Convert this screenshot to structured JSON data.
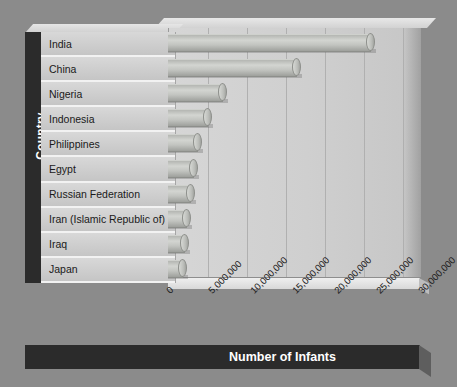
{
  "chart_data": {
    "type": "bar",
    "orientation": "horizontal",
    "title": "",
    "xlabel": "Number of Infants",
    "ylabel": "Country",
    "categories": [
      "India",
      "China",
      "Nigeria",
      "Indonesia",
      "Philippines",
      "Egypt",
      "Russian Federation",
      "Iran (Islamic Republic of)",
      "Iraq",
      "Japan"
    ],
    "values": [
      24200000,
      15400000,
      6600000,
      4800000,
      3600000,
      3100000,
      2700000,
      2300000,
      2000000,
      1800000
    ],
    "xlim": [
      0,
      30000000
    ],
    "xticks": [
      0,
      5000000,
      10000000,
      15000000,
      20000000,
      25000000,
      30000000
    ],
    "xtick_labels": [
      "0",
      "5,000,000",
      "10,000,000",
      "15,000,000",
      "20,000,000",
      "25,000,000",
      "30,000,000"
    ],
    "grid": true,
    "legend": false,
    "style": "3d-cylinder",
    "bar_color": "#c2c4c0",
    "background_color": "#8b8b8b",
    "plot_background_color": "#cfcfcf",
    "axis_band_color": "#2b2b2b",
    "axis_label_color": "#ffffff"
  }
}
